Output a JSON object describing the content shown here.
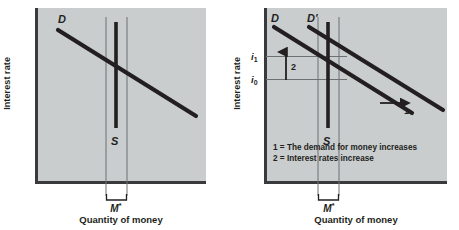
{
  "figure": {
    "background": "#ffffff",
    "plot_background": "#c9cdce",
    "ink": "#231f20"
  },
  "chart_data": {
    "type": "line",
    "title": "",
    "panels": [
      {
        "id": "left",
        "name": "money-market-equilibrium",
        "xlabel": "Quantity of money",
        "ylabel": "Interest rate",
        "quantity_marker": "M*",
        "curves": [
          {
            "name": "D",
            "label": "D",
            "role": "money-demand",
            "slope": "downward"
          },
          {
            "name": "S",
            "label": "S",
            "role": "money-supply",
            "slope": "vertical"
          }
        ],
        "annotations": []
      },
      {
        "id": "right",
        "name": "money-demand-shift",
        "xlabel": "Quantity of money",
        "ylabel": "Interest rate",
        "quantity_marker": "M*",
        "curves": [
          {
            "name": "D",
            "label": "D",
            "role": "money-demand-initial",
            "slope": "downward"
          },
          {
            "name": "Dprime",
            "label": "D'",
            "role": "money-demand-new",
            "slope": "downward"
          },
          {
            "name": "S",
            "label": "S",
            "role": "money-supply",
            "slope": "vertical"
          }
        ],
        "rate_ticks": [
          {
            "label": "i",
            "subscript": "1",
            "position": "upper",
            "meaning": "new interest rate"
          },
          {
            "label": "i",
            "subscript": "0",
            "position": "lower",
            "meaning": "initial interest rate"
          }
        ],
        "annotations": [
          {
            "id": "1",
            "label": "1",
            "direction": "right",
            "meaning": "demand curve shifts right"
          },
          {
            "id": "2",
            "label": "2",
            "direction": "up",
            "meaning": "interest rate rises"
          }
        ],
        "legend": [
          "1 = The demand for money increases",
          "2 = Interest rates increase"
        ]
      }
    ]
  }
}
